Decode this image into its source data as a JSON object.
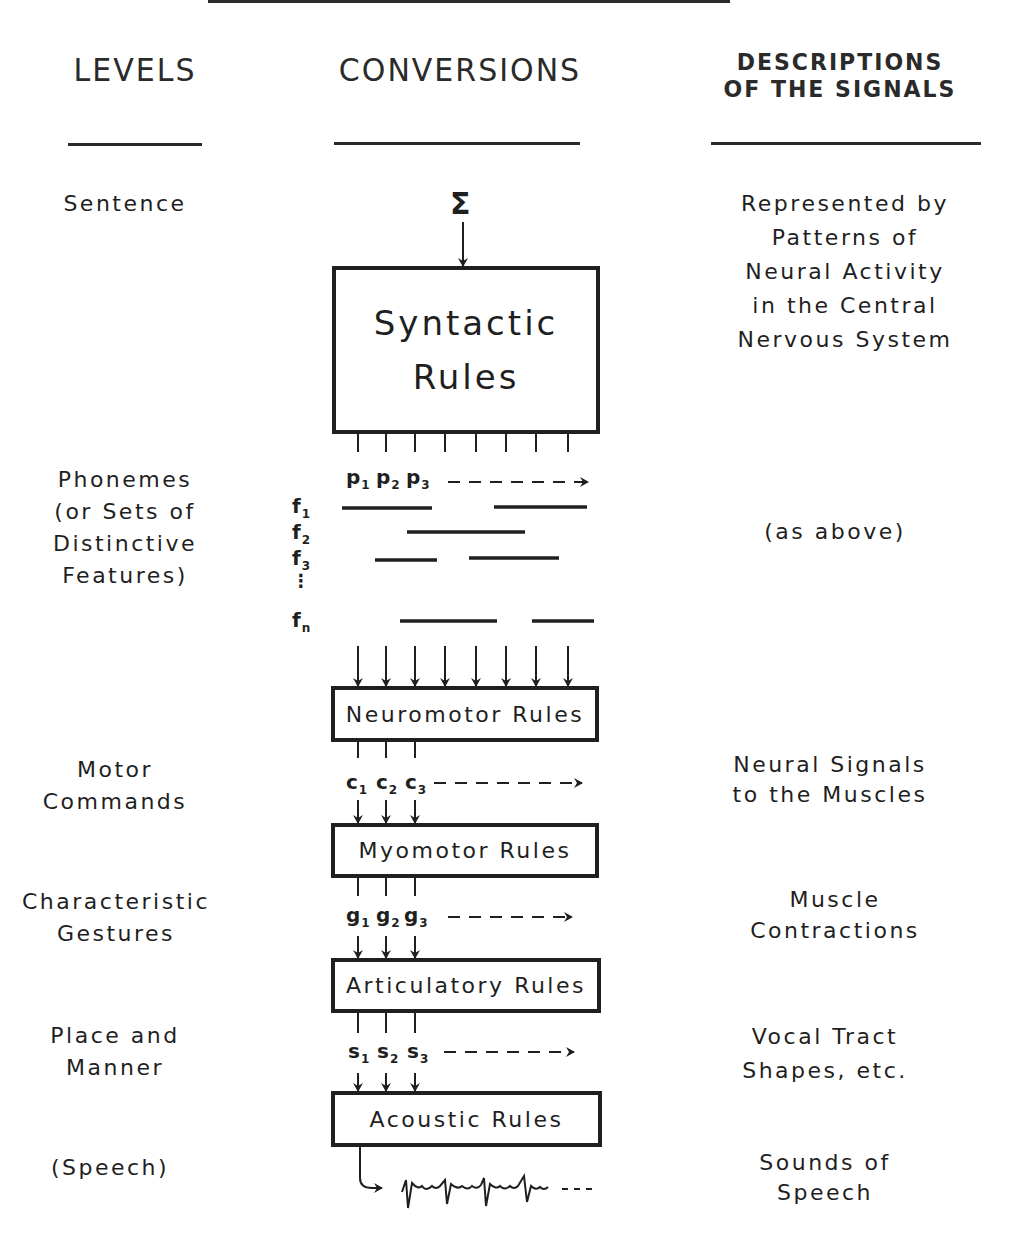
{
  "headers": {
    "levels": "LEVELS",
    "conversions": "CONVERSIONS",
    "descriptions_line1": "DESCRIPTIONS",
    "descriptions_line2": "OF THE SIGNALS"
  },
  "levels": [
    {
      "lines": [
        "Sentence"
      ]
    },
    {
      "lines": [
        "Phonemes",
        "(or Sets of",
        "Distinctive",
        "Features)"
      ]
    },
    {
      "lines": [
        "Motor",
        "Commands"
      ]
    },
    {
      "lines": [
        "Characteristic",
        "Gestures"
      ]
    },
    {
      "lines": [
        "Place and",
        "Manner"
      ]
    },
    {
      "lines": [
        "(Speech)"
      ]
    }
  ],
  "descriptions": [
    {
      "lines": [
        "Represented by",
        "Patterns of",
        "Neural Activity",
        "in the Central",
        "Nervous System"
      ]
    },
    {
      "lines": [
        "(as above)"
      ]
    },
    {
      "lines": [
        "Neural Signals",
        "to the Muscles"
      ]
    },
    {
      "lines": [
        "Muscle",
        "Contractions"
      ]
    },
    {
      "lines": [
        "Vocal Tract",
        "Shapes, etc."
      ]
    },
    {
      "lines": [
        "Sounds of",
        "Speech"
      ]
    }
  ],
  "conversions": {
    "input_symbol": "Σ",
    "boxes": [
      {
        "line1": "Syntactic",
        "line2": "Rules"
      },
      {
        "label": "Neuromotor Rules"
      },
      {
        "label": "Myomotor Rules"
      },
      {
        "label": "Articulatory Rules"
      },
      {
        "label": "Acoustic Rules"
      }
    ],
    "phoneme_signals": {
      "base": "p",
      "subs": [
        "1",
        "2",
        "3"
      ]
    },
    "feature_labels": [
      {
        "base": "f",
        "sub": "1"
      },
      {
        "base": "f",
        "sub": "2"
      },
      {
        "base": "f",
        "sub": "3"
      },
      {
        "base": "f",
        "sub": "n"
      }
    ],
    "feature_ellipsis": "⋮",
    "motor_signals": {
      "base": "c",
      "subs": [
        "1",
        "2",
        "3"
      ]
    },
    "gesture_signals": {
      "base": "g",
      "subs": [
        "1",
        "2",
        "3"
      ]
    },
    "shape_signals": {
      "base": "s",
      "subs": [
        "1",
        "2",
        "3"
      ]
    }
  },
  "icons": {
    "arrow": "arrow-icon",
    "waveform": "speech-waveform-icon"
  }
}
